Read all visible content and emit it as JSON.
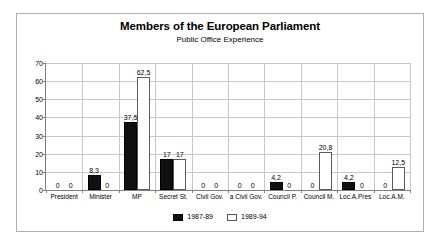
{
  "chart_data": {
    "type": "bar",
    "title": "Members of the European Parliament",
    "subtitle": "Public Office Experience",
    "xlabel": "",
    "ylabel": "",
    "ylim": [
      0,
      70
    ],
    "yticks": [
      0,
      10,
      20,
      30,
      40,
      50,
      60,
      70
    ],
    "grid": true,
    "legend_position": "bottom",
    "categories": [
      "President",
      "Minister",
      "MP",
      "Secret St.",
      "Civil Gov.",
      "a Civil Gov.",
      "Council P.",
      "Council M.",
      "Loc.A.Pres",
      "Loc.A.M."
    ],
    "series": [
      {
        "name": "1987-89",
        "color": "#101010",
        "values": [
          0,
          8.3,
          37.5,
          17,
          0,
          0,
          4.2,
          0,
          4.2,
          0
        ],
        "labels": [
          "0",
          "8,3",
          "37,5",
          "17",
          "0",
          "0",
          "4,2",
          "0",
          "4,2",
          "0"
        ]
      },
      {
        "name": "1989-94",
        "color": "#ffffff",
        "values": [
          0,
          0,
          62.5,
          17,
          0,
          0,
          0,
          20.8,
          0,
          12.5
        ],
        "labels": [
          "0",
          "0",
          "62,5",
          "17",
          "0",
          "0",
          "0",
          "20,8",
          "0",
          "12,5"
        ]
      }
    ]
  },
  "legend": {
    "entries": [
      {
        "label": "1987-89"
      },
      {
        "label": "1989-94"
      }
    ]
  }
}
